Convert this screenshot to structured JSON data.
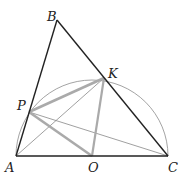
{
  "figure": {
    "points": {
      "A": "A",
      "B": "B",
      "C": "C",
      "K": "K",
      "P": "P",
      "O": "O"
    },
    "colors": {
      "triangle": "#222222",
      "thin": "#888888",
      "highlight": "#aaaaaa",
      "arc": "#999999"
    }
  }
}
